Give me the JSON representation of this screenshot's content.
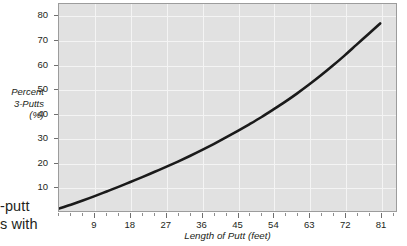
{
  "caption": {
    "line1": "-putt",
    "line2": "s with"
  },
  "chart_data": {
    "type": "line",
    "title": "",
    "xlabel": "Length of Putt (feet)",
    "ylabel": "Percent 3-Putts (%)",
    "ylabel_lines": [
      "Percent",
      "3-Putts",
      "(%)"
    ],
    "xlim": [
      0,
      85
    ],
    "ylim": [
      0,
      85
    ],
    "xticks": [
      9,
      18,
      27,
      36,
      45,
      54,
      63,
      72,
      81
    ],
    "xtick_labels": [
      "9",
      "18",
      "27",
      "36",
      "45",
      "54",
      "63",
      "72",
      "81"
    ],
    "yticks": [
      10,
      20,
      30,
      40,
      50,
      60,
      70,
      80
    ],
    "ytick_labels": [
      "10",
      "20",
      "30",
      "40",
      "50",
      "60",
      "70",
      "80"
    ],
    "x_minor_step": 3,
    "grid": true,
    "grid_color": "#f4f4f4",
    "plot_background": "#e1e1e1",
    "line_color": "#1a1a1a",
    "line_width": 2.6,
    "legend": "none",
    "x": [
      0,
      3,
      6,
      9,
      12,
      15,
      18,
      21,
      24,
      27,
      30,
      33,
      36,
      39,
      42,
      45,
      48,
      51,
      54,
      57,
      60,
      63,
      66,
      69,
      72,
      75,
      78,
      81
    ],
    "y": [
      1.0,
      2.6,
      4.3,
      6.1,
      8.0,
      9.9,
      11.9,
      13.9,
      16.0,
      18.1,
      20.3,
      22.6,
      25.0,
      27.5,
      30.1,
      32.8,
      35.6,
      38.5,
      41.6,
      44.8,
      48.2,
      51.8,
      55.6,
      59.6,
      63.8,
      68.2,
      72.6,
      77.0
    ]
  }
}
